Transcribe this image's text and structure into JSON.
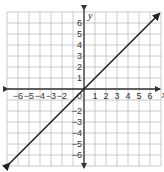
{
  "chart_data": {
    "type": "line",
    "title": "",
    "xlabel": "x",
    "ylabel": "y",
    "xlim": [
      -7,
      7
    ],
    "ylim": [
      -7,
      7
    ],
    "grid": true,
    "x_ticks": [
      -6,
      -5,
      -4,
      -3,
      -2,
      1,
      2,
      3,
      4,
      5,
      6
    ],
    "y_ticks": [
      6,
      5,
      4,
      3,
      2,
      1,
      -2,
      -3,
      -4,
      -5,
      -6
    ],
    "origin_label": "0",
    "series": [
      {
        "name": "y = x",
        "x": [
          -7,
          7
        ],
        "y": [
          -7,
          7
        ],
        "arrows": "both"
      }
    ]
  },
  "colors": {
    "grid": "#bdbdbd",
    "axis": "#333333",
    "line": "#222222",
    "background": "#ffffff"
  }
}
